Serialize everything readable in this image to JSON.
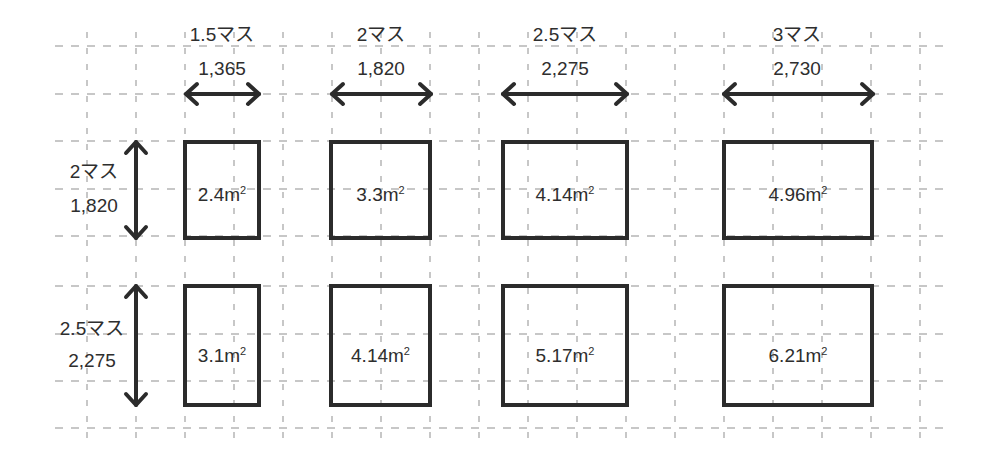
{
  "diagram": {
    "title": "",
    "grid": {
      "x_start": 87,
      "x_step": 49,
      "x_count": 18,
      "y_lines": [
        46,
        94,
        141,
        189,
        236,
        286,
        334,
        381,
        428
      ]
    },
    "columns": [
      {
        "masu": "1.5マス",
        "mm": "1,365"
      },
      {
        "masu": "2マス",
        "mm": "1,820"
      },
      {
        "masu": "2.5マス",
        "mm": "2,275"
      },
      {
        "masu": "3マス",
        "mm": "2,730"
      }
    ],
    "rows": [
      {
        "masu": "2マス",
        "mm": "1,820"
      },
      {
        "masu": "2.5マス",
        "mm": "2,275"
      }
    ],
    "cells": [
      [
        {
          "area": "2.4m",
          "unit_sup": "2"
        },
        {
          "area": "3.3m",
          "unit_sup": "2"
        },
        {
          "area": "4.14m",
          "unit_sup": "2"
        },
        {
          "area": "4.96m",
          "unit_sup": "2"
        }
      ],
      [
        {
          "area": "3.1m",
          "unit_sup": "2"
        },
        {
          "area": "4.14m",
          "unit_sup": "2"
        },
        {
          "area": "5.17m",
          "unit_sup": "2"
        },
        {
          "area": "6.21m",
          "unit_sup": "2"
        }
      ]
    ],
    "colors": {
      "line": "#2b2b2b",
      "grid": "#9a9a9a",
      "background": "#ffffff"
    }
  }
}
